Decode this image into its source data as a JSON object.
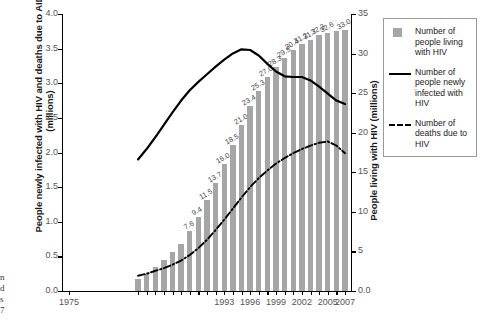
{
  "chart_data": {
    "type": "bar",
    "title": "",
    "xlabel": "",
    "ylabel": "People newly infected with HIV and deaths due to AIDS (millions)",
    "y2label": "People living with HIV (millions)",
    "ylim": [
      0.0,
      4.0
    ],
    "y2lim": [
      0.0,
      35
    ],
    "xlim": [
      1975,
      2007
    ],
    "grid": false,
    "legend_position": "right-outside",
    "yticks": [
      "0.0",
      "0.5",
      "1.0",
      "1.5",
      "2.0",
      "2.5",
      "3.0",
      "3.5",
      "4.0"
    ],
    "y2ticks": [
      "0.0",
      "5",
      "10",
      "15",
      "20",
      "25",
      "30",
      "35"
    ],
    "xticks": [
      "1975",
      "1993",
      "1996",
      "1999",
      "2002",
      "2005",
      "2007"
    ],
    "xtick_years": [
      1975,
      1993,
      1996,
      1999,
      2002,
      2005,
      2007
    ],
    "x": [
      1983,
      1984,
      1985,
      1986,
      1987,
      1988,
      1989,
      1990,
      1991,
      1992,
      1993,
      1994,
      1995,
      1996,
      1997,
      1998,
      1999,
      2000,
      2001,
      2002,
      2003,
      2004,
      2005,
      2006,
      2007
    ],
    "series": [
      {
        "name": "Number of people living with HIV",
        "type": "bar",
        "axis": "right",
        "unit": "millions",
        "color": "#a6a6a6",
        "values": [
          1.5,
          2.2,
          3.0,
          3.9,
          4.9,
          6.0,
          7.6,
          9.4,
          11.5,
          13.7,
          16.0,
          18.5,
          21.0,
          23.4,
          25.3,
          27.0,
          28.3,
          29.5,
          30.4,
          31.2,
          31.7,
          32.3,
          32.6,
          32.8,
          33.0
        ],
        "labels": [
          "",
          "",
          "",
          "",
          "",
          "",
          "7.6",
          "9.4",
          "11.5",
          "13.7",
          "16.0",
          "18.5",
          "21.0",
          "23.4",
          "25.3",
          "27.0",
          "28.3",
          "29.5",
          "30.4",
          "31.2",
          "31.7",
          "32.3",
          "32.6",
          "",
          "33.0"
        ]
      },
      {
        "name": "Number of people newly infected with HIV",
        "type": "line",
        "style": "solid",
        "axis": "left",
        "unit": "millions",
        "color": "#000000",
        "values": [
          1.9,
          2.05,
          2.22,
          2.4,
          2.58,
          2.75,
          2.9,
          3.02,
          3.13,
          3.24,
          3.34,
          3.43,
          3.49,
          3.48,
          3.4,
          3.28,
          3.17,
          3.1,
          3.09,
          3.09,
          3.04,
          2.95,
          2.85,
          2.75,
          2.7
        ]
      },
      {
        "name": "Number of deaths due to HIV",
        "type": "line",
        "style": "dash-dot",
        "axis": "left",
        "unit": "millions",
        "color": "#000000",
        "values": [
          0.22,
          0.25,
          0.29,
          0.33,
          0.38,
          0.44,
          0.52,
          0.62,
          0.74,
          0.88,
          1.03,
          1.19,
          1.35,
          1.5,
          1.63,
          1.74,
          1.84,
          1.92,
          1.99,
          2.05,
          2.1,
          2.14,
          2.16,
          2.1,
          1.99
        ]
      }
    ]
  },
  "axes": {
    "left_title": "People newly infected with HIV and deaths due to AIDS (millions)",
    "right_title": "People living with HIV (millions)"
  },
  "legend": {
    "items": [
      {
        "marker": "square-swatch",
        "label": "Number of people living with HIV"
      },
      {
        "marker": "solid-line",
        "label": "Number of people newly infected with HIV"
      },
      {
        "marker": "dash-dot-line",
        "label": "Number of deaths due to HIV"
      }
    ]
  },
  "side_text": "n\nd\ns\n7",
  "colors": {
    "bar": "#a6a6a6",
    "line": "#000000",
    "axis": "#000000",
    "tick_label": "#555555",
    "bar_label": "#4a4a4a",
    "legend_border": "#9a9a9a",
    "background": "#ffffff"
  }
}
